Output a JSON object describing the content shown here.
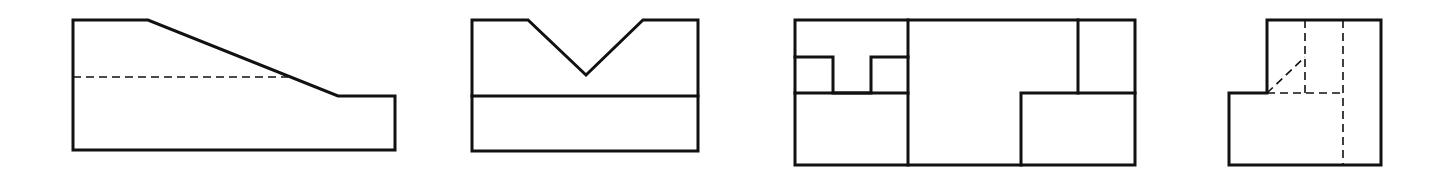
{
  "diagram": {
    "type": "orthographic-projection-views",
    "background": "#ffffff",
    "line_color": "#111111",
    "views": [
      {
        "id": "view-1",
        "name": "sloped-block-view",
        "outline": [
          [
            73,
            20
          ],
          [
            148,
            20
          ],
          [
            338,
            96
          ],
          [
            395,
            96
          ],
          [
            395,
            150
          ],
          [
            73,
            150
          ]
        ],
        "hidden_lines": [
          [
            [
              73,
              77
            ],
            [
              288,
              77
            ]
          ]
        ]
      },
      {
        "id": "view-2",
        "name": "v-groove-block-view",
        "outline": [
          [
            472,
            20
          ],
          [
            528,
            20
          ],
          [
            586,
            75
          ],
          [
            643,
            20
          ],
          [
            698,
            20
          ],
          [
            698,
            151
          ],
          [
            472,
            151
          ]
        ],
        "visible_lines": [
          [
            [
              472,
              96
            ],
            [
              698,
              96
            ]
          ]
        ]
      },
      {
        "id": "view-3",
        "name": "t-slot-block-view",
        "outline": [
          [
            795,
            20
          ],
          [
            1135,
            20
          ],
          [
            1135,
            165
          ],
          [
            795,
            165
          ]
        ],
        "visible_lines": [
          [
            [
              908,
              20
            ],
            [
              908,
              165
            ]
          ],
          [
            [
              795,
              57
            ],
            [
              833,
              57
            ],
            [
              833,
              93
            ],
            [
              871,
              93
            ],
            [
              871,
              57
            ],
            [
              908,
              57
            ]
          ],
          [
            [
              795,
              93
            ],
            [
              908,
              93
            ]
          ],
          [
            [
              1078,
              20
            ],
            [
              1078,
              93
            ]
          ],
          [
            [
              1021,
              165
            ],
            [
              1021,
              93
            ],
            [
              1135,
              93
            ]
          ]
        ]
      },
      {
        "id": "view-4",
        "name": "stepped-block-side-view",
        "outline": [
          [
            1267,
            20
          ],
          [
            1381,
            20
          ],
          [
            1381,
            165
          ],
          [
            1229,
            165
          ],
          [
            1229,
            93
          ],
          [
            1267,
            93
          ]
        ],
        "hidden_lines": [
          [
            [
              1305,
              20
            ],
            [
              1305,
              93
            ]
          ],
          [
            [
              1343,
              20
            ],
            [
              1343,
              165
            ]
          ],
          [
            [
              1267,
              93
            ],
            [
              1305,
              57
            ]
          ],
          [
            [
              1267,
              93
            ],
            [
              1343,
              93
            ]
          ]
        ]
      }
    ]
  }
}
